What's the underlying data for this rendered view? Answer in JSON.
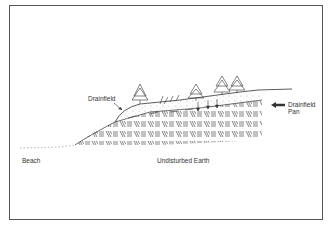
{
  "diagram": {
    "type": "cross-section illustration",
    "labels": {
      "drainfield": "Drainfield",
      "drainfield_pan_line1": "Drainfield",
      "drainfield_pan_line2": "Pan",
      "beach": "Beach",
      "undisturbed_earth": "Undisturbed Earth"
    },
    "colors": {
      "line": "#333333",
      "border": "#555555",
      "background": "#ffffff"
    }
  }
}
